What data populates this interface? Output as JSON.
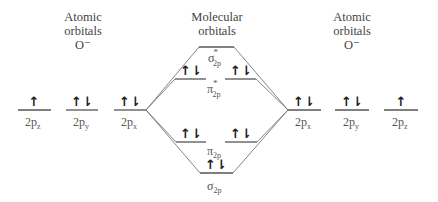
{
  "headings": {
    "left": {
      "line1": "Atomic",
      "line2": "orbitals",
      "line3": "O⁻"
    },
    "center": {
      "line1": "Molecular",
      "line2": "orbitals"
    },
    "right": {
      "line1": "Atomic",
      "line2": "orbitals",
      "line3": "O⁻"
    }
  },
  "left_atom": {
    "orbitals": [
      {
        "name": "2p",
        "sub": "z",
        "electrons": "↑"
      },
      {
        "name": "2p",
        "sub": "y",
        "electrons": "↑⇂"
      },
      {
        "name": "2p",
        "sub": "x",
        "electrons": "↑⇂"
      }
    ]
  },
  "right_atom": {
    "orbitals": [
      {
        "name": "2p",
        "sub": "x",
        "electrons": "↑⇂"
      },
      {
        "name": "2p",
        "sub": "y",
        "electrons": "↑⇂"
      },
      {
        "name": "2p",
        "sub": "z",
        "electrons": "↑"
      }
    ]
  },
  "molecular_orbitals": {
    "sigma_star": {
      "symbol": "σ",
      "sup": "*",
      "sub": "2p",
      "electrons": ""
    },
    "pi_star": {
      "symbol": "π",
      "sup": "*",
      "sub": "2p",
      "electrons_left": "↑⇂",
      "electrons_right": "↑⇂"
    },
    "pi": {
      "symbol": "π",
      "sub": "2p",
      "electrons_left": "↑⇂",
      "electrons_right": "↑⇂"
    },
    "sigma": {
      "symbol": "σ",
      "sub": "2p",
      "electrons": "↑⇂"
    }
  }
}
